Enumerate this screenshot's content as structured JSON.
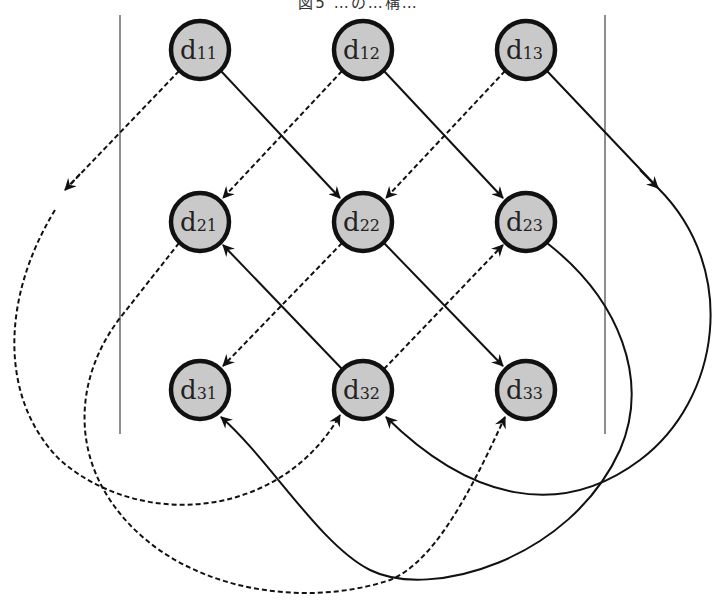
{
  "figure": {
    "title_partial": "図5 …の…構…",
    "colors": {
      "node_fill": "#c9c9c9",
      "node_stroke": "#111111",
      "edge": "#111111",
      "divider": "#444444"
    },
    "dividers": [
      {
        "x": 120,
        "y1": 15,
        "y2": 434
      },
      {
        "x": 605,
        "y1": 15,
        "y2": 434
      }
    ],
    "nodes": [
      {
        "id": "d11",
        "base": "d",
        "sub": "11",
        "cx": 200,
        "cy": 50
      },
      {
        "id": "d12",
        "base": "d",
        "sub": "12",
        "cx": 363,
        "cy": 50
      },
      {
        "id": "d13",
        "base": "d",
        "sub": "13",
        "cx": 526,
        "cy": 50
      },
      {
        "id": "d21",
        "base": "d",
        "sub": "21",
        "cx": 200,
        "cy": 222
      },
      {
        "id": "d22",
        "base": "d",
        "sub": "22",
        "cx": 363,
        "cy": 222
      },
      {
        "id": "d23",
        "base": "d",
        "sub": "23",
        "cx": 526,
        "cy": 222
      },
      {
        "id": "d31",
        "base": "d",
        "sub": "31",
        "cx": 200,
        "cy": 390
      },
      {
        "id": "d32",
        "base": "d",
        "sub": "32",
        "cx": 363,
        "cy": 390
      },
      {
        "id": "d33",
        "base": "d",
        "sub": "33",
        "cx": 526,
        "cy": 390
      }
    ],
    "edges": [
      {
        "from": "d11",
        "to": "d22",
        "style": "solid",
        "path": "M221,71 L340,198"
      },
      {
        "from": "d12",
        "to": "d23",
        "style": "solid",
        "path": "M384,71 L503,198"
      },
      {
        "from": "d12",
        "to": "d21",
        "style": "dashed",
        "path": "M342,71 L223,198"
      },
      {
        "from": "d13",
        "to": "d22",
        "style": "dashed",
        "path": "M505,71 L386,198"
      },
      {
        "from": "d22",
        "to": "d31",
        "style": "dashed",
        "path": "M342,243 L223,366"
      },
      {
        "from": "d22",
        "to": "d33",
        "style": "solid",
        "path": "M384,243 L503,366"
      },
      {
        "from": "d32",
        "to": "d21",
        "style": "solid",
        "path": "M342,369 L223,245"
      },
      {
        "from": "d32",
        "to": "d23",
        "style": "dashed",
        "path": "M384,369 L503,245"
      },
      {
        "from": "d11",
        "to": "d32",
        "style": "dashed",
        "path": "M179,71 L65,190 M55,210 C0,300 0,400 60,460 C140,530 280,520 340,415"
      },
      {
        "from": "d21",
        "to": "d33",
        "style": "dashed",
        "path": "M179,243 L120,318 C80,370 70,440 110,500 C170,590 300,610 390,580 C440,560 480,470 505,417"
      },
      {
        "from": "d13",
        "to": "d32",
        "style": "solid",
        "path": "M547,71 L658,188 C740,270 720,400 640,460 C560,520 470,500 386,417"
      },
      {
        "from": "d23",
        "to": "d31",
        "style": "solid",
        "path": "M547,243 C620,300 650,380 620,450 C570,560 430,600 370,570 C320,545 270,460 221,417"
      }
    ]
  }
}
